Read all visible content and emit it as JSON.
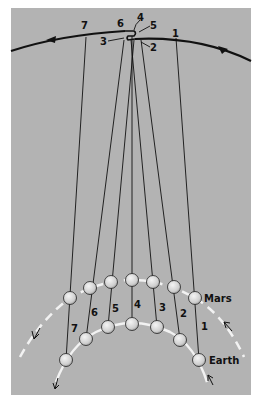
{
  "diagram": {
    "colors": {
      "background": "#ffffff",
      "panel": "#b3b3b3",
      "ink": "#111111",
      "orbit_dash": "#f2f2f2",
      "planet_fill": "#d9d9d9"
    },
    "labels": {
      "mars": "Mars",
      "earth": "Earth"
    },
    "positions": [
      {
        "n": "1",
        "earth": [
          199,
          360
        ],
        "mars": [
          195,
          298
        ],
        "sky": [
          186,
          45
        ]
      },
      {
        "n": "2",
        "earth": [
          180,
          340
        ],
        "mars": [
          174,
          287
        ],
        "sky": [
          141,
          37
        ]
      },
      {
        "n": "3",
        "earth": [
          157,
          327
        ],
        "mars": [
          153,
          282
        ],
        "sky": [
          128,
          37
        ]
      },
      {
        "n": "4",
        "earth": [
          132,
          324
        ],
        "mars": [
          132,
          280
        ],
        "sky": [
          132,
          31
        ]
      },
      {
        "n": "5",
        "earth": [
          108,
          327
        ],
        "mars": [
          111,
          282
        ],
        "sky": [
          137,
          37
        ]
      },
      {
        "n": "6",
        "earth": [
          86,
          339
        ],
        "mars": [
          90,
          288
        ],
        "sky": [
          123,
          38
        ]
      },
      {
        "n": "7",
        "earth": [
          66,
          360
        ],
        "mars": [
          70,
          298
        ],
        "sky": [
          85,
          37
        ]
      }
    ],
    "sky_labels": [
      {
        "n": "7",
        "x": 81,
        "y": 29
      },
      {
        "n": "6",
        "x": 117,
        "y": 27
      },
      {
        "n": "4",
        "x": 137,
        "y": 21
      },
      {
        "n": "5",
        "x": 150,
        "y": 29
      },
      {
        "n": "3",
        "x": 100,
        "y": 45
      },
      {
        "n": "2",
        "x": 150,
        "y": 51
      },
      {
        "n": "1",
        "x": 172,
        "y": 37
      }
    ],
    "line_labels": [
      {
        "n": "7",
        "x": 71,
        "y": 332
      },
      {
        "n": "6",
        "x": 91,
        "y": 316
      },
      {
        "n": "5",
        "x": 112,
        "y": 312
      },
      {
        "n": "4",
        "x": 134,
        "y": 308
      },
      {
        "n": "3",
        "x": 159,
        "y": 311
      },
      {
        "n": "2",
        "x": 180,
        "y": 317
      },
      {
        "n": "1",
        "x": 201,
        "y": 330
      }
    ]
  }
}
